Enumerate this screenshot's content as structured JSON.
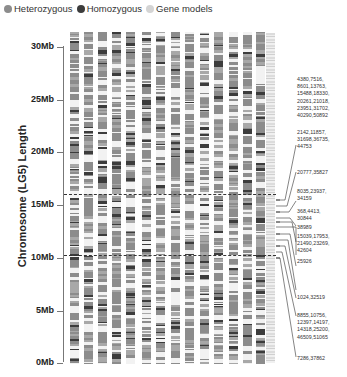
{
  "legend": [
    {
      "label": "Heterozygous",
      "color": "#8c8c8c"
    },
    {
      "label": "Homozygous",
      "color": "#3c3c3c"
    },
    {
      "label": "Gene models",
      "color": "#d4d4d4"
    }
  ],
  "axis": {
    "ylabel": "Chromosome (LG5) Length",
    "ticks": [
      "30Mb",
      "25Mb",
      "20Mb",
      "15Mb",
      "10Mb",
      "5Mb",
      "0Mb"
    ]
  },
  "annotations": [
    "4380,7516,\n8601,13763,\n15488,18330,\n20261,21018,\n23951,31702,\n40290,50892",
    "2142,11857,\n31698,36735,\n44753",
    "20777,35827",
    "8035,23937,\n34159",
    "368,4413,\n30844",
    "38989",
    "15039,17953,\n21490,23269,\n42604",
    "25926",
    "1024,32519",
    "8855,10756,\n12397,14197,\n14318,25200,\n46509,51065",
    "7286,37862"
  ],
  "chart_data": {
    "type": "heatmap",
    "title": "",
    "ylabel": "Chromosome (LG5) Length",
    "yticks": [
      "0Mb",
      "5Mb",
      "10Mb",
      "15Mb",
      "20Mb",
      "25Mb",
      "30Mb"
    ],
    "ylim": [
      0,
      31
    ],
    "legend": [
      "Heterozygous",
      "Homozygous",
      "Gene models"
    ],
    "num_sample_columns": 14,
    "extra_columns": [
      "Gene models"
    ],
    "dashed_lines_mb": [
      15.9,
      10.2
    ],
    "gene_annotations": [
      {
        "label": "4380,7516,8601,13763,15488,18330,20261,21018,23951,31702,40290,50892",
        "approx_mb": 15.5
      },
      {
        "label": "2142,11857,31698,36735,44753",
        "approx_mb": 15.0
      },
      {
        "label": "20777,35827",
        "approx_mb": 14.5
      },
      {
        "label": "8035,23937,34159",
        "approx_mb": 14.0
      },
      {
        "label": "368,4413,30844",
        "approx_mb": 13.5
      },
      {
        "label": "38989",
        "approx_mb": 13.0
      },
      {
        "label": "15039,17953,21490,23269,42604",
        "approx_mb": 12.0
      },
      {
        "label": "25926",
        "approx_mb": 11.5
      },
      {
        "label": "1024,32519",
        "approx_mb": 11.0
      },
      {
        "label": "8855,10756,12397,14197,14318,25200,46509,51065",
        "approx_mb": 10.5
      },
      {
        "label": "7286,37862",
        "approx_mb": 10.0
      }
    ]
  }
}
